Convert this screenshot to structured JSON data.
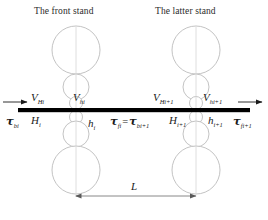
{
  "figure": {
    "width": 268,
    "height": 220,
    "background": "#ffffff",
    "line_color": "#b9b9b9",
    "strip_color": "#000000",
    "text_color": "#1a1a1a"
  },
  "titles": {
    "front_stand": "The front stand",
    "latter_stand": "The latter stand"
  },
  "velocities": {
    "entry_front": {
      "symbol": "V",
      "sub": "Hi"
    },
    "exit_front": {
      "symbol": "V",
      "sub": "hi"
    },
    "entry_latter": {
      "symbol": "V",
      "sub": "Hi+1"
    },
    "exit_latter": {
      "symbol": "V",
      "sub": "hi+1"
    }
  },
  "tensions": {
    "back_front": {
      "symbol": "τ",
      "sub": "bi"
    },
    "interstand_left": {
      "symbol": "τ",
      "sub": "fi"
    },
    "interstand_equals": "=",
    "interstand_right": {
      "symbol": "τ",
      "sub": "bi+1"
    },
    "front_latter": {
      "symbol": "τ",
      "sub": "fi+1"
    }
  },
  "thicknesses": {
    "entry_front": {
      "symbol": "H",
      "sub": "i"
    },
    "exit_front": {
      "symbol": "h",
      "sub": "i"
    },
    "entry_latter": {
      "symbol": "H",
      "sub": "i+1"
    },
    "exit_latter": {
      "symbol": "h",
      "sub": "i+1"
    }
  },
  "dimension": {
    "label": "L"
  },
  "stands": [
    {
      "name": "front-stand",
      "center_x": 76,
      "rolls": [
        {
          "name": "upper-backup-roll",
          "cy": 50,
          "r": 24
        },
        {
          "name": "upper-intermediate-roll",
          "cy": 87,
          "r": 13
        },
        {
          "name": "upper-work-roll",
          "cy": 103,
          "r": 6.5
        },
        {
          "name": "lower-work-roll",
          "cy": 117,
          "r": 6.5
        },
        {
          "name": "lower-intermediate-roll",
          "cy": 134,
          "r": 13
        },
        {
          "name": "lower-backup-roll",
          "cy": 170,
          "r": 24
        }
      ]
    },
    {
      "name": "latter-stand",
      "center_x": 196,
      "rolls": [
        {
          "name": "upper-backup-roll",
          "cy": 50,
          "r": 24
        },
        {
          "name": "upper-intermediate-roll",
          "cy": 87,
          "r": 13
        },
        {
          "name": "upper-work-roll",
          "cy": 103,
          "r": 6.5
        },
        {
          "name": "lower-work-roll",
          "cy": 117,
          "r": 6.5
        },
        {
          "name": "lower-intermediate-roll",
          "cy": 134,
          "r": 13
        },
        {
          "name": "lower-backup-roll",
          "cy": 170,
          "r": 24
        }
      ]
    }
  ],
  "strip": {
    "x1": 18,
    "x2": 250,
    "y": 110,
    "thickness": 4
  }
}
